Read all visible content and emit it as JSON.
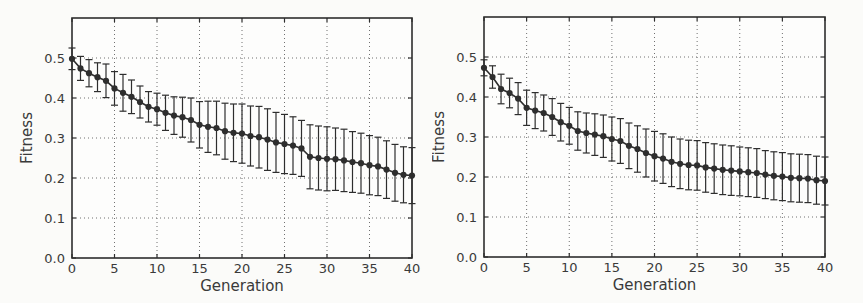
{
  "figure": {
    "background": "#fbfbf9",
    "ink": "#2e2e2e",
    "grid_color": "#707070",
    "plot_background": "#fdfdfc"
  },
  "chart_data": [
    {
      "id": "left-fitness-plot",
      "type": "line",
      "title": "",
      "xlabel": "Generation",
      "ylabel": "Fitness",
      "xlim": [
        0,
        40
      ],
      "ylim": [
        0,
        0.6
      ],
      "xtick_labels": [
        "0",
        "5",
        "10",
        "15",
        "20",
        "25",
        "30",
        "35",
        "40"
      ],
      "ytick_labels": [
        "0.0",
        "0.1",
        "0.2",
        "0.3",
        "0.4",
        "0.5"
      ],
      "grid": "dotted",
      "legend": "none",
      "marker": "circle",
      "error_bars": true,
      "x": [
        0,
        1,
        2,
        3,
        4,
        5,
        6,
        7,
        8,
        9,
        10,
        11,
        12,
        13,
        14,
        15,
        16,
        17,
        18,
        19,
        20,
        21,
        22,
        23,
        24,
        25,
        26,
        27,
        28,
        29,
        30,
        31,
        32,
        33,
        34,
        35,
        36,
        37,
        38,
        39,
        40
      ],
      "y": [
        0.498,
        0.474,
        0.462,
        0.452,
        0.443,
        0.424,
        0.413,
        0.403,
        0.39,
        0.378,
        0.372,
        0.363,
        0.356,
        0.352,
        0.345,
        0.333,
        0.328,
        0.325,
        0.317,
        0.313,
        0.311,
        0.305,
        0.302,
        0.296,
        0.289,
        0.285,
        0.281,
        0.274,
        0.253,
        0.25,
        0.248,
        0.247,
        0.244,
        0.24,
        0.237,
        0.232,
        0.229,
        0.221,
        0.213,
        0.208,
        0.206
      ],
      "yerr": [
        0.027,
        0.03,
        0.034,
        0.036,
        0.042,
        0.042,
        0.046,
        0.042,
        0.04,
        0.038,
        0.04,
        0.044,
        0.047,
        0.05,
        0.055,
        0.058,
        0.064,
        0.067,
        0.07,
        0.072,
        0.074,
        0.075,
        0.077,
        0.077,
        0.075,
        0.074,
        0.072,
        0.07,
        0.08,
        0.08,
        0.08,
        0.078,
        0.078,
        0.076,
        0.075,
        0.074,
        0.073,
        0.072,
        0.071,
        0.07,
        0.07
      ]
    },
    {
      "id": "right-fitness-plot",
      "type": "line",
      "title": "",
      "xlabel": "Generation",
      "ylabel": "Fitness",
      "xlim": [
        0,
        40
      ],
      "ylim": [
        0,
        0.6
      ],
      "xtick_labels": [
        "0",
        "5",
        "10",
        "15",
        "20",
        "25",
        "30",
        "35",
        "40"
      ],
      "ytick_labels": [
        "0.0",
        "0.1",
        "0.2",
        "0.3",
        "0.4",
        "0.5"
      ],
      "grid": "dotted",
      "legend": "none",
      "marker": "circle",
      "error_bars": true,
      "x": [
        0,
        1,
        2,
        3,
        4,
        5,
        6,
        7,
        8,
        9,
        10,
        11,
        12,
        13,
        14,
        15,
        16,
        17,
        18,
        19,
        20,
        21,
        22,
        23,
        24,
        25,
        26,
        27,
        28,
        29,
        30,
        31,
        32,
        33,
        34,
        35,
        36,
        37,
        38,
        39,
        40
      ],
      "y": [
        0.473,
        0.45,
        0.42,
        0.41,
        0.396,
        0.373,
        0.366,
        0.36,
        0.35,
        0.337,
        0.328,
        0.315,
        0.31,
        0.306,
        0.302,
        0.295,
        0.29,
        0.278,
        0.27,
        0.26,
        0.252,
        0.246,
        0.238,
        0.233,
        0.23,
        0.229,
        0.224,
        0.221,
        0.218,
        0.216,
        0.214,
        0.212,
        0.21,
        0.206,
        0.203,
        0.201,
        0.198,
        0.197,
        0.196,
        0.192,
        0.19
      ],
      "yerr": [
        0.02,
        0.028,
        0.037,
        0.037,
        0.04,
        0.044,
        0.045,
        0.045,
        0.046,
        0.047,
        0.046,
        0.048,
        0.05,
        0.052,
        0.053,
        0.055,
        0.056,
        0.057,
        0.058,
        0.06,
        0.062,
        0.062,
        0.062,
        0.062,
        0.062,
        0.062,
        0.062,
        0.062,
        0.062,
        0.062,
        0.061,
        0.061,
        0.061,
        0.06,
        0.06,
        0.06,
        0.06,
        0.06,
        0.06,
        0.06,
        0.06
      ]
    }
  ]
}
